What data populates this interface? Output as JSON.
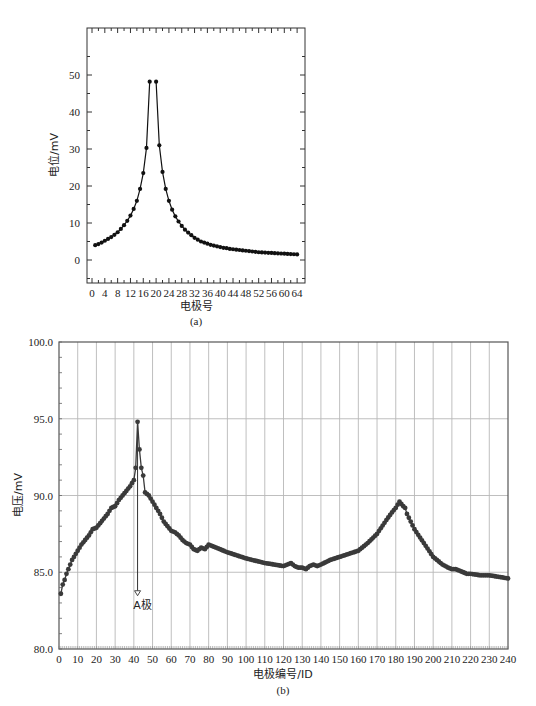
{
  "chart_data": [
    {
      "id": "a",
      "type": "line",
      "caption": "(a)",
      "title": "",
      "xlabel": "电极号",
      "ylabel": "电位/mV",
      "xlim": [
        0,
        66
      ],
      "ylim": [
        -5,
        55
      ],
      "xticks": [
        0,
        4,
        8,
        12,
        16,
        20,
        24,
        28,
        32,
        36,
        40,
        44,
        48,
        52,
        56,
        60,
        64
      ],
      "yticks": [
        0,
        10,
        20,
        30,
        40,
        50
      ],
      "grid": false,
      "markers": true,
      "series": [
        {
          "name": "电位",
          "x": [
            1,
            2,
            3,
            4,
            5,
            6,
            7,
            8,
            9,
            10,
            11,
            12,
            13,
            14,
            15,
            16,
            17,
            18,
            20,
            21,
            22,
            23,
            24,
            25,
            26,
            27,
            28,
            29,
            30,
            31,
            32,
            33,
            34,
            35,
            36,
            37,
            38,
            39,
            40,
            41,
            42,
            43,
            44,
            45,
            46,
            47,
            48,
            49,
            50,
            51,
            52,
            53,
            54,
            55,
            56,
            57,
            58,
            59,
            60,
            61,
            62,
            63,
            64
          ],
          "values": [
            4.0,
            4.3,
            4.7,
            5.2,
            5.7,
            6.2,
            6.8,
            7.5,
            8.4,
            9.4,
            10.6,
            12.0,
            13.8,
            16.0,
            19.2,
            23.5,
            30.3,
            48.2,
            48.2,
            31.0,
            23.8,
            19.2,
            16.0,
            13.6,
            11.8,
            10.4,
            9.2,
            8.2,
            7.4,
            6.7,
            6.0,
            5.5,
            5.0,
            4.7,
            4.4,
            4.1,
            3.9,
            3.7,
            3.5,
            3.3,
            3.2,
            3.0,
            2.9,
            2.8,
            2.7,
            2.6,
            2.5,
            2.4,
            2.3,
            2.2,
            2.1,
            2.05,
            2.0,
            1.95,
            1.9,
            1.85,
            1.8,
            1.75,
            1.7,
            1.65,
            1.6,
            1.55,
            1.5
          ]
        }
      ]
    },
    {
      "id": "b",
      "type": "line",
      "caption": "(b)",
      "title": "",
      "xlabel": "电极编号/ID",
      "ylabel": "电压/mV",
      "xlim": [
        0,
        240
      ],
      "ylim": [
        80,
        100
      ],
      "xticks": [
        0,
        10,
        20,
        30,
        40,
        50,
        60,
        70,
        80,
        90,
        100,
        110,
        120,
        130,
        140,
        150,
        160,
        170,
        180,
        190,
        200,
        210,
        220,
        230,
        240
      ],
      "yticks": [
        "80.0",
        "85.0",
        "90.0",
        "95.0",
        "100.0"
      ],
      "ytick_values": [
        80,
        85,
        90,
        95,
        100
      ],
      "grid": true,
      "markers": true,
      "annotation": {
        "label": "A极",
        "x": 42,
        "y_from": 94.8,
        "y_to": 83.6
      },
      "series": [
        {
          "name": "电压",
          "x": [
            1,
            2,
            3,
            4,
            5,
            6,
            7,
            8,
            9,
            10,
            12,
            14,
            16,
            18,
            20,
            22,
            24,
            26,
            28,
            30,
            32,
            34,
            36,
            38,
            40,
            41,
            42,
            43,
            44,
            45,
            46,
            48,
            50,
            52,
            54,
            56,
            58,
            60,
            62,
            64,
            66,
            68,
            70,
            72,
            74,
            76,
            78,
            80,
            82,
            84,
            86,
            90,
            100,
            110,
            120,
            122,
            124,
            126,
            128,
            130,
            132,
            134,
            136,
            138,
            140,
            145,
            150,
            155,
            160,
            165,
            170,
            175,
            178,
            180,
            182,
            184,
            185,
            186,
            188,
            190,
            195,
            200,
            205,
            208,
            210,
            212,
            214,
            216,
            218,
            220,
            225,
            230,
            235,
            240
          ],
          "values": [
            83.6,
            84.2,
            84.5,
            84.9,
            85.2,
            85.5,
            85.8,
            86.0,
            86.2,
            86.4,
            86.8,
            87.1,
            87.4,
            87.8,
            87.9,
            88.2,
            88.5,
            88.8,
            89.2,
            89.3,
            89.7,
            90.0,
            90.3,
            90.6,
            91.0,
            91.8,
            94.8,
            93.0,
            91.8,
            91.3,
            90.2,
            90.0,
            89.6,
            89.2,
            88.8,
            88.3,
            88.0,
            87.7,
            87.6,
            87.4,
            87.1,
            86.9,
            86.8,
            86.5,
            86.4,
            86.6,
            86.5,
            86.8,
            86.7,
            86.6,
            86.5,
            86.3,
            85.9,
            85.6,
            85.4,
            85.5,
            85.6,
            85.4,
            85.3,
            85.3,
            85.2,
            85.4,
            85.5,
            85.4,
            85.5,
            85.8,
            86.0,
            86.2,
            86.4,
            86.9,
            87.5,
            88.4,
            88.9,
            89.2,
            89.6,
            89.3,
            89.2,
            88.8,
            88.3,
            87.8,
            86.9,
            86.0,
            85.5,
            85.3,
            85.2,
            85.2,
            85.1,
            85.0,
            84.9,
            84.9,
            84.8,
            84.8,
            84.7,
            84.6
          ]
        }
      ]
    }
  ]
}
